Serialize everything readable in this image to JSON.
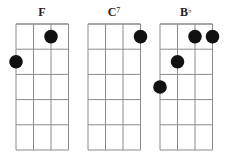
{
  "diagram": {
    "type": "ukulele-chord-chart",
    "strings": 4,
    "frets": 5,
    "colors": {
      "line": "#8a8a8a",
      "dot": "#111111",
      "text": "#222222"
    },
    "chords": [
      {
        "name": "F",
        "root": "F",
        "suffix": "",
        "dots": [
          {
            "string": 3,
            "fret": 1
          },
          {
            "string": 1,
            "fret": 2
          }
        ]
      },
      {
        "name": "C7",
        "root": "C",
        "suffix": "7",
        "dots": [
          {
            "string": 4,
            "fret": 1
          }
        ]
      },
      {
        "name": "B♭",
        "root": "B",
        "suffix": "♭",
        "dots": [
          {
            "string": 3,
            "fret": 1
          },
          {
            "string": 4,
            "fret": 1
          },
          {
            "string": 2,
            "fret": 2
          },
          {
            "string": 1,
            "fret": 3
          }
        ]
      }
    ]
  }
}
